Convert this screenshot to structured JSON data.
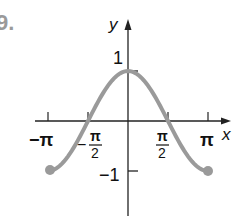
{
  "problem_label": "9.",
  "chart_data": {
    "type": "line",
    "title": "",
    "function": "y = cos x",
    "xlabel": "x",
    "ylabel": "y",
    "xlim": [
      -3.14159,
      3.14159
    ],
    "ylim": [
      -1,
      1
    ],
    "x_ticks": [
      {
        "value": -3.14159,
        "label": "−π"
      },
      {
        "value": -1.5708,
        "label": "−π/2"
      },
      {
        "value": 1.5708,
        "label": "π/2"
      },
      {
        "value": 3.14159,
        "label": "π"
      }
    ],
    "y_ticks": [
      {
        "value": 1,
        "label": "1"
      },
      {
        "value": -1,
        "label": "−1"
      }
    ],
    "series": [
      {
        "name": "cos x",
        "x": [
          -3.14159,
          -2.35619,
          -1.5708,
          -0.7854,
          0,
          0.7854,
          1.5708,
          2.35619,
          3.14159
        ],
        "values": [
          -1,
          -0.707,
          0,
          0.707,
          1,
          0.707,
          0,
          -0.707,
          -1
        ],
        "color": "#9a9a9a",
        "endpoints": "closed"
      }
    ],
    "grid": false,
    "legend": null
  },
  "labels": {
    "x_axis": "x",
    "y_axis": "y",
    "y_one": "1",
    "y_neg_one": "−1",
    "x_neg_pi": "−π",
    "x_pi": "π",
    "pi": "π",
    "two": "2",
    "minus": "−"
  },
  "colors": {
    "axis": "#222222",
    "curve": "#9a9a9a",
    "problem_label": "#9a9a9a"
  }
}
